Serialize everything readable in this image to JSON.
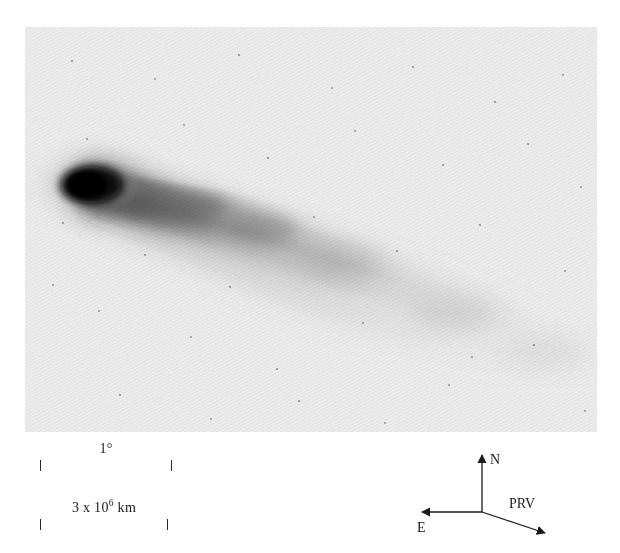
{
  "figure": {
    "kind": "astronomical-photographic-plate",
    "background_color": "#ffffff",
    "plate": {
      "background_color": "#f2f2f2",
      "ink_color": "#101010",
      "left": 25,
      "top": 27,
      "width": 572,
      "height": 405
    }
  },
  "scale_bars": [
    {
      "name": "angular-scale",
      "label": "1",
      "unit_symbol": "°",
      "label_full": "1°",
      "length_px": 132
    },
    {
      "name": "linear-scale",
      "label_mantissa": "3 x 10",
      "label_exponent": "6",
      "label_unit": " km",
      "label_full": "3 x 10⁶ km",
      "length_px": 128
    }
  ],
  "compass": {
    "north_label": "N",
    "east_label": "E",
    "prv_label": "PRV",
    "origin": {
      "x": 77,
      "y": 69
    },
    "north_tip": {
      "x": 77,
      "y": 12
    },
    "east_tip": {
      "x": 17,
      "y": 69
    },
    "prv_tip": {
      "x": 140,
      "y": 90
    }
  },
  "comet": {
    "coma": {
      "center_x": 70,
      "center_y": 158,
      "radius_x": 34,
      "radius_y": 21,
      "core_color": "#0d0d0d"
    },
    "tail": {
      "direction": "lower-right",
      "position_angle_deg": 18,
      "streamer_count": 5,
      "tint": "#6f6f6f"
    }
  }
}
